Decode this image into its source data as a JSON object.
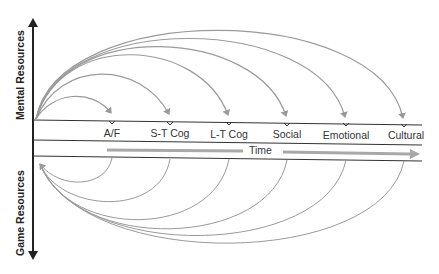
{
  "axes": {
    "top_label": "Mental Resources",
    "bottom_label": "Game Resources",
    "time_label": "Time"
  },
  "categories": [
    {
      "label": "A/F",
      "x": 112
    },
    {
      "label": "S-T Cog",
      "x": 170
    },
    {
      "label": "L-T Cog",
      "x": 229
    },
    {
      "label": "Social",
      "x": 287
    },
    {
      "label": "Emotional",
      "x": 346
    },
    {
      "label": "Cultural",
      "x": 404
    }
  ],
  "colors": {
    "arc": "#9a9a9a",
    "axis": "#222222",
    "time_arrow": "#a8a8a8"
  }
}
